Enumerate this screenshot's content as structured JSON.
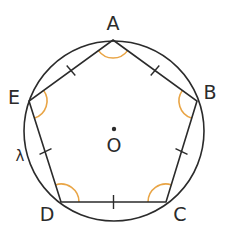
{
  "diagram": {
    "colors": {
      "stroke": "#2b2b2b",
      "angle_arc": "#E9A546",
      "background": "#ffffff"
    },
    "circle": {
      "name": "λ",
      "label": "λ",
      "cx": 114,
      "cy": 131,
      "r": 90
    },
    "center": {
      "name": "O",
      "label": "O",
      "x": 114,
      "y": 129
    },
    "vertices": [
      {
        "name": "A",
        "label": "A",
        "x": 113,
        "y": 40
      },
      {
        "name": "B",
        "label": "B",
        "x": 197,
        "y": 101
      },
      {
        "name": "C",
        "label": "C",
        "x": 166,
        "y": 202
      },
      {
        "name": "D",
        "label": "D",
        "x": 61,
        "y": 202
      },
      {
        "name": "E",
        "label": "E",
        "x": 29,
        "y": 101
      }
    ],
    "sides": [
      "AB",
      "BC",
      "CD",
      "DE",
      "EA"
    ],
    "equal_side_marks": 5,
    "equal_angle_marks": 5
  }
}
